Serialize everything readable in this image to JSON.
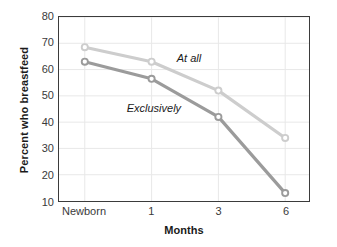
{
  "chart_data": {
    "type": "line",
    "title": "",
    "xlabel": "Months",
    "ylabel": "Percent who breastfeed",
    "categories": [
      "Newborn",
      "1",
      "3",
      "6"
    ],
    "ylim": [
      10,
      80
    ],
    "yticks": [
      10,
      20,
      30,
      40,
      50,
      60,
      70,
      80
    ],
    "ytick_labels": [
      "10",
      "20",
      "30",
      "40",
      "50",
      "60",
      "70",
      "80"
    ],
    "grid": true,
    "grid_axis": "both",
    "legend_position": "inline-annotations",
    "marker": "open-circle",
    "series": [
      {
        "name": "At all",
        "label": "At all",
        "color": "#cdcdcd",
        "values": [
          68.5,
          63,
          52,
          34
        ]
      },
      {
        "name": "Exclusively",
        "label": "Exclusively",
        "color": "#9b9b9b",
        "values": [
          63,
          56.5,
          42,
          13
        ]
      }
    ],
    "annotations": [
      {
        "text": "At all",
        "x_frac": 0.52,
        "y_value": 64.5
      },
      {
        "text": "Exclusively",
        "x_frac": 0.345,
        "y_value": 45.5
      }
    ]
  },
  "style": {
    "plot_background": "#ffffff",
    "frame_color": "#3b3b3b",
    "grid_color": "#e8e8e8",
    "text_color": "#1a1a1a",
    "tick_text_color": "#3a3a3a"
  }
}
